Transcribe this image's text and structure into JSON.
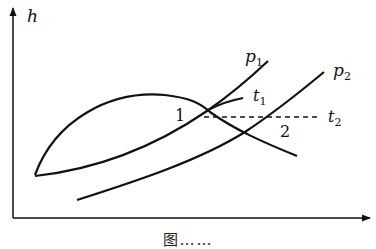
{
  "diagram": {
    "type": "h-diagram",
    "axes": {
      "y_label": "h",
      "x_label": ""
    },
    "curves": [
      {
        "name": "p1",
        "label_main": "p",
        "label_sub": "1",
        "kind": "isobar"
      },
      {
        "name": "p2",
        "label_main": "p",
        "label_sub": "2",
        "kind": "isobar"
      },
      {
        "name": "t1",
        "label_main": "t",
        "label_sub": "1",
        "kind": "isotherm"
      },
      {
        "name": "t2",
        "label_main": "t",
        "label_sub": "2",
        "kind": "isotherm",
        "style": "dashed"
      }
    ],
    "points": [
      {
        "id": "1",
        "label": "1"
      },
      {
        "id": "2",
        "label": "2"
      }
    ],
    "colors": {
      "stroke": "#111111",
      "background": "#ffffff"
    }
  },
  "caption": "图……"
}
